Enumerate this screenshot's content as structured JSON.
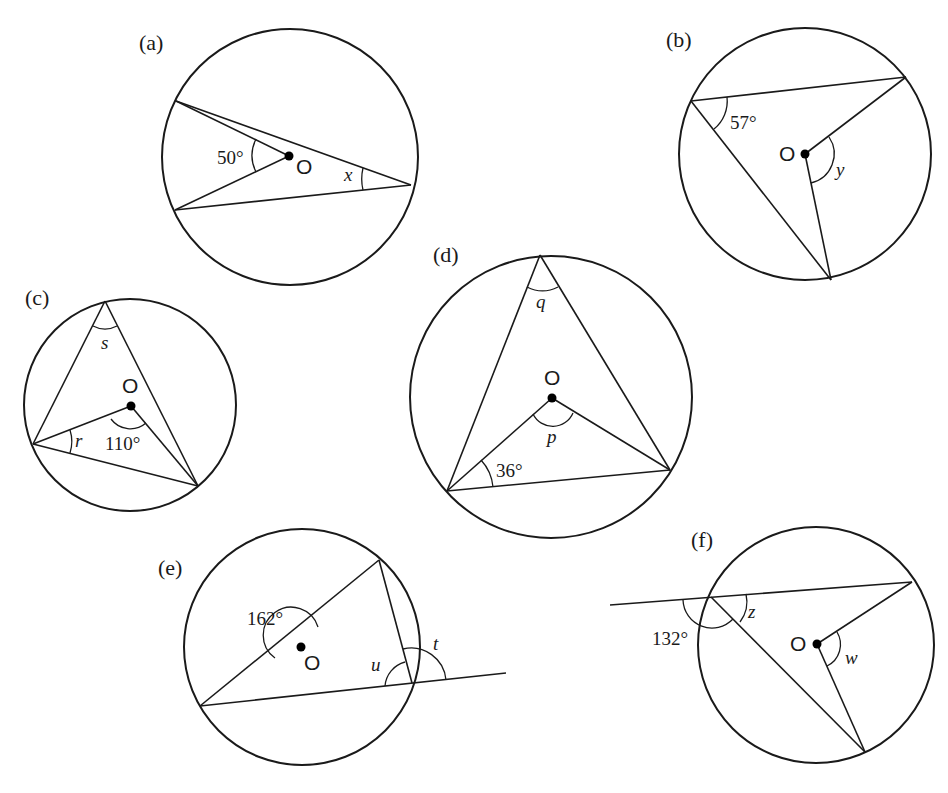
{
  "diagrams": [
    {
      "id": "a",
      "label": "(a)",
      "center_label": "O",
      "given_angle": "50°",
      "unknown": "x",
      "description": "Angle at centre O subtended by chord is 50°; x is inscribed angle on same arc"
    },
    {
      "id": "b",
      "label": "(b)",
      "center_label": "O",
      "given_angle": "57°",
      "unknown": "y",
      "description": "Inscribed angle 57°; y is the angle at centre O on the same arc"
    },
    {
      "id": "c",
      "label": "(c)",
      "center_label": "O",
      "given_angle": "110°",
      "unknowns": [
        "s",
        "r"
      ],
      "description": "Angle at centre 110°; s is inscribed angle, r is base angle of isosceles triangle"
    },
    {
      "id": "d",
      "label": "(d)",
      "center_label": "O",
      "given_angle": "36°",
      "unknowns": [
        "q",
        "p"
      ],
      "description": "Base angle 36° in isosceles triangle with apex O; p is angle at centre, q is inscribed angle"
    },
    {
      "id": "e",
      "label": "(e)",
      "center_label": "O",
      "given_angle": "162°",
      "unknowns": [
        "u",
        "t"
      ],
      "description": "Reflex/obtuse angle at centre 162°; u is inscribed angle, t is exterior angle on extended chord"
    },
    {
      "id": "f",
      "label": "(f)",
      "center_label": "O",
      "given_angle": "132°",
      "unknowns": [
        "z",
        "w"
      ],
      "description": "Exterior angle 132° on extended chord; z is inscribed angle, w is angle at centre"
    }
  ]
}
